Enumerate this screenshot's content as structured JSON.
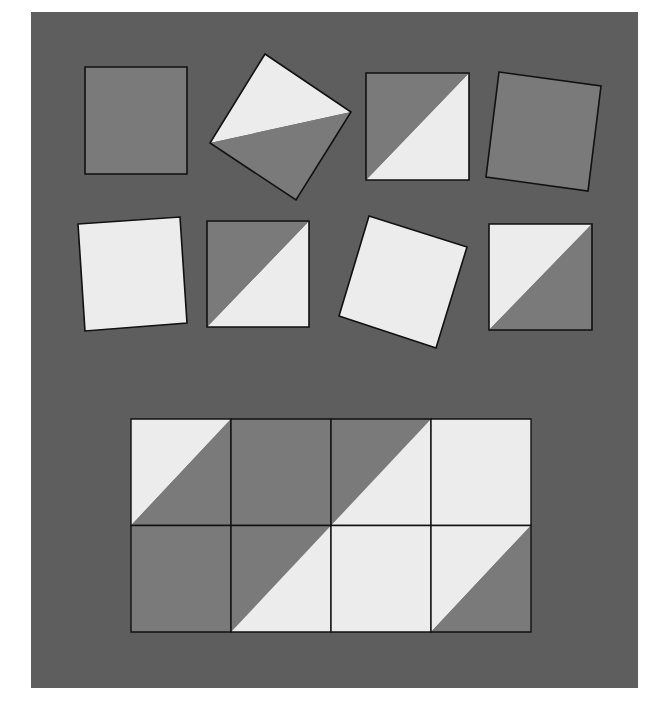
{
  "colors": {
    "background": "#5e5e5e",
    "dark": "#7a7a7a",
    "light": "#ececec",
    "stroke": "#111111"
  },
  "pieces": [
    {
      "id": "piece-1",
      "type": "solid",
      "fill": "dark",
      "points": [
        [
          85,
          67
        ],
        [
          187,
          67
        ],
        [
          187,
          174
        ],
        [
          85,
          174
        ]
      ]
    },
    {
      "id": "piece-2",
      "type": "split",
      "points": [
        [
          265,
          54
        ],
        [
          351,
          112
        ],
        [
          296,
          200
        ],
        [
          210,
          143
        ]
      ],
      "light": [
        [
          265,
          54
        ],
        [
          351,
          112
        ],
        [
          210,
          143
        ]
      ],
      "dark": [
        [
          351,
          112
        ],
        [
          296,
          200
        ],
        [
          210,
          143
        ]
      ]
    },
    {
      "id": "piece-3",
      "type": "split",
      "points": [
        [
          366,
          73
        ],
        [
          469,
          73
        ],
        [
          469,
          180
        ],
        [
          366,
          180
        ]
      ],
      "dark": [
        [
          366,
          73
        ],
        [
          469,
          73
        ],
        [
          366,
          180
        ]
      ],
      "light": [
        [
          469,
          73
        ],
        [
          469,
          180
        ],
        [
          366,
          180
        ]
      ]
    },
    {
      "id": "piece-4",
      "type": "solid",
      "fill": "dark",
      "points": [
        [
          499,
          72
        ],
        [
          601,
          86
        ],
        [
          588,
          191
        ],
        [
          486,
          177
        ]
      ]
    },
    {
      "id": "piece-5",
      "type": "solid",
      "fill": "light",
      "points": [
        [
          78,
          224
        ],
        [
          180,
          217
        ],
        [
          187,
          323
        ],
        [
          85,
          331
        ]
      ]
    },
    {
      "id": "piece-6",
      "type": "split",
      "points": [
        [
          207,
          221
        ],
        [
          309,
          221
        ],
        [
          309,
          327
        ],
        [
          207,
          327
        ]
      ],
      "dark": [
        [
          207,
          221
        ],
        [
          309,
          221
        ],
        [
          207,
          327
        ]
      ],
      "light": [
        [
          309,
          221
        ],
        [
          309,
          327
        ],
        [
          207,
          327
        ]
      ]
    },
    {
      "id": "piece-7",
      "type": "solid",
      "fill": "light",
      "points": [
        [
          369,
          216
        ],
        [
          467,
          247
        ],
        [
          436,
          348
        ],
        [
          339,
          316
        ]
      ]
    },
    {
      "id": "piece-8",
      "type": "split",
      "points": [
        [
          489,
          224
        ],
        [
          592,
          224
        ],
        [
          592,
          330
        ],
        [
          489,
          330
        ]
      ],
      "light": [
        [
          489,
          224
        ],
        [
          592,
          224
        ],
        [
          489,
          330
        ]
      ],
      "dark": [
        [
          592,
          224
        ],
        [
          592,
          330
        ],
        [
          489,
          330
        ]
      ]
    }
  ],
  "grid": {
    "x": 131,
    "y": 419,
    "cols": 4,
    "rows": 2,
    "cell_w": 100,
    "cell_h": 106.5,
    "cells": [
      [
        "light-tl",
        "dark",
        "dark-tl",
        "light"
      ],
      [
        "dark",
        "dark-tl",
        "light",
        "light-tl"
      ]
    ]
  }
}
